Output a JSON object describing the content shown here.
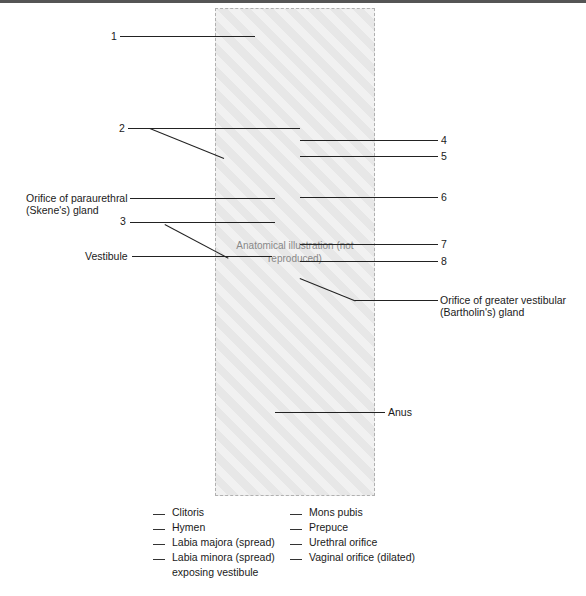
{
  "figure": {
    "image_placeholder_text": "Anatomical illustration (not reproduced)",
    "callouts_left": [
      {
        "id": "1",
        "text": "1"
      },
      {
        "id": "2",
        "text": "2"
      },
      {
        "id": "skene",
        "text_line1": "Orifice of paraurethral",
        "text_line2": "(Skene's) gland"
      },
      {
        "id": "3",
        "text": "3"
      },
      {
        "id": "vestibule",
        "text": "Vestibule"
      }
    ],
    "callouts_right": [
      {
        "id": "4",
        "text": "4"
      },
      {
        "id": "5",
        "text": "5"
      },
      {
        "id": "6",
        "text": "6"
      },
      {
        "id": "7",
        "text": "7"
      },
      {
        "id": "8",
        "text": "8"
      },
      {
        "id": "bartholin",
        "text_line1": "Orifice of greater vestibular",
        "text_line2": "(Bartholin's) gland"
      },
      {
        "id": "anus",
        "text": "Anus"
      }
    ]
  },
  "legend": {
    "left_column": [
      {
        "text": "Clitoris"
      },
      {
        "text": "Hymen"
      },
      {
        "text": "Labia majora (spread)"
      },
      {
        "text": "Labia minora (spread)",
        "text_line2": "exposing vestibule"
      }
    ],
    "right_column": [
      {
        "text": "Mons pubis"
      },
      {
        "text": "Prepuce"
      },
      {
        "text": "Urethral orifice"
      },
      {
        "text": "Vaginal orifice (dilated)"
      }
    ]
  }
}
